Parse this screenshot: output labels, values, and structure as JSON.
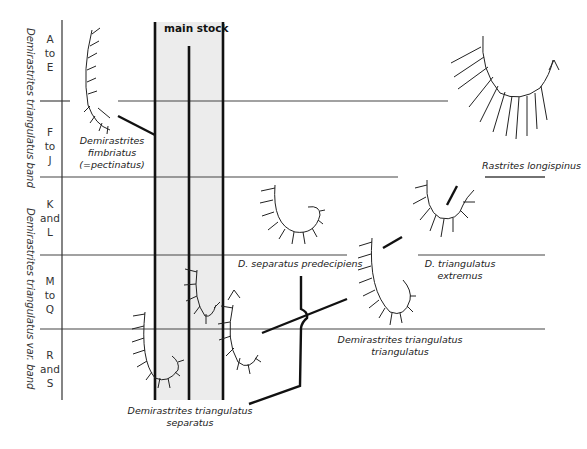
{
  "diagram": {
    "title": "main stock",
    "zones": [
      {
        "id": "a-e",
        "lines": [
          "A",
          "to",
          "E"
        ]
      },
      {
        "id": "f-j",
        "lines": [
          "F",
          "to",
          "J"
        ]
      },
      {
        "id": "k-l",
        "lines": [
          "K",
          "and",
          "L"
        ]
      },
      {
        "id": "m-q",
        "lines": [
          "M",
          "to",
          "Q"
        ]
      },
      {
        "id": "r-s",
        "lines": [
          "R",
          "and",
          "S"
        ]
      }
    ],
    "bands": [
      {
        "label": "Demirastrites triangulatus band",
        "zones": [
          "A to E",
          "F to J"
        ]
      },
      {
        "label": "Demirastrites triangulatus var. band",
        "zones": [
          "K and L",
          "M to Q",
          "R and S"
        ]
      }
    ],
    "taxa": [
      {
        "id": "fimbriatus",
        "lines": [
          "Demirastrites",
          "fimbriatus",
          "(=pectinatus)"
        ]
      },
      {
        "id": "longispinus",
        "lines": [
          "Rastrites longispinus"
        ]
      },
      {
        "id": "predecipiens",
        "lines": [
          "D. separatus predecipiens"
        ]
      },
      {
        "id": "extremus",
        "lines": [
          "D. triangulatus",
          "extremus"
        ]
      },
      {
        "id": "triangulatus",
        "lines": [
          "Demirastrites triangulatus",
          "triangulatus"
        ]
      },
      {
        "id": "separatus",
        "lines": [
          "Demirastrites triangulatus",
          "separatus"
        ]
      }
    ],
    "colors": {
      "line": "#111111",
      "gridline": "#444444",
      "main_stock_fill": "#ececec",
      "text": "#222222"
    }
  }
}
